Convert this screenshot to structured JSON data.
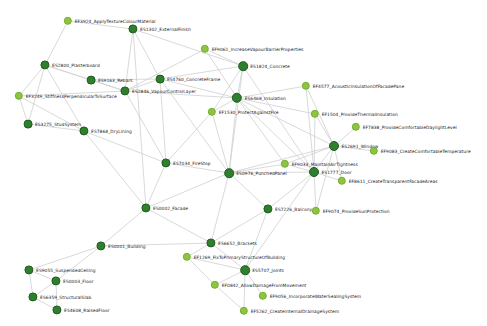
{
  "view": {
    "title": "Building Element / Function Network Graph",
    "background_color": "#ffffff",
    "edge_color": "#cfcfcf",
    "node_color_dark": "#2f7f2f",
    "node_color_light": "#8cc63f",
    "label_color": "#20201f",
    "width": 487,
    "height": 326
  },
  "chart_data": {
    "type": "network",
    "title": "",
    "node_count": 37,
    "edge_count": 71,
    "nodes": [
      {
        "id": "EF3924",
        "label": "EF3924_ApplyTextureColourMaterial",
        "x": 68,
        "y": 21,
        "r": 4.2,
        "kind": "light",
        "label_side": "right"
      },
      {
        "id": "ES1302",
        "label": "ES1302_ExternalFinish",
        "x": 133,
        "y": 29,
        "r": 4.6,
        "kind": "dark",
        "label_side": "right"
      },
      {
        "id": "EF9061",
        "label": "EF9061_IncreaseVapourBarrierProperties",
        "x": 205,
        "y": 49,
        "r": 4.2,
        "kind": "light",
        "label_side": "right"
      },
      {
        "id": "ES2800",
        "label": "ES2800_Plasterboard",
        "x": 45,
        "y": 65,
        "r": 4.6,
        "kind": "dark",
        "label_side": "right"
      },
      {
        "id": "ES1824",
        "label": "ES1824_Concrete",
        "x": 243,
        "y": 66,
        "r": 4.8,
        "kind": "dark",
        "label_side": "right"
      },
      {
        "id": "ES9163",
        "label": "ES9163_Rebars",
        "x": 91,
        "y": 80,
        "r": 4.4,
        "kind": "dark",
        "label_side": "right"
      },
      {
        "id": "ES4760",
        "label": "ES4760_ConcreteFrame",
        "x": 160,
        "y": 79,
        "r": 4.4,
        "kind": "dark",
        "label_side": "right"
      },
      {
        "id": "EF4577",
        "label": "EF4577_AcousticInsulationOfFacadePane",
        "x": 306,
        "y": 86,
        "r": 4.2,
        "kind": "light",
        "label_side": "right"
      },
      {
        "id": "EF3249",
        "label": "EF3249_StiffnessPerpendicularToSurface",
        "x": 19,
        "y": 96,
        "r": 4.2,
        "kind": "light",
        "label_side": "right"
      },
      {
        "id": "ES2846",
        "label": "ES2846_VapourControlLayer",
        "x": 125,
        "y": 91,
        "r": 4.6,
        "kind": "dark",
        "label_side": "right"
      },
      {
        "id": "ES6468",
        "label": "ES6468_Insulation",
        "x": 237,
        "y": 98,
        "r": 5.2,
        "kind": "dark",
        "label_side": "right"
      },
      {
        "id": "EF1530",
        "label": "EF1530_ProtectAgainstFire",
        "x": 212,
        "y": 112,
        "r": 4.2,
        "kind": "light",
        "label_side": "right"
      },
      {
        "id": "EF1504",
        "label": "EF1504_ProvideThermalInsulation",
        "x": 315,
        "y": 114,
        "r": 4.2,
        "kind": "light",
        "label_side": "right"
      },
      {
        "id": "ES3275",
        "label": "ES3275_StudSystem",
        "x": 28,
        "y": 124,
        "r": 4.4,
        "kind": "dark",
        "label_side": "right"
      },
      {
        "id": "EF7838",
        "label": "EF7838_ProvideComfortableDaylightLevel",
        "x": 356,
        "y": 127,
        "r": 4.2,
        "kind": "light",
        "label_side": "right"
      },
      {
        "id": "ES7868",
        "label": "ES7868_DryLining",
        "x": 84,
        "y": 131,
        "r": 4.6,
        "kind": "dark",
        "label_side": "right"
      },
      {
        "id": "ES2691",
        "label": "ES2691_Window",
        "x": 334,
        "y": 146,
        "r": 5.0,
        "kind": "dark",
        "label_side": "right"
      },
      {
        "id": "EF9083",
        "label": "EF9083_CreateComfortableTemperature",
        "x": 374,
        "y": 151,
        "r": 4.2,
        "kind": "light",
        "label_side": "right"
      },
      {
        "id": "EF9033",
        "label": "EF9033_MaintainAirTightness",
        "x": 285,
        "y": 164,
        "r": 4.2,
        "kind": "light",
        "label_side": "right"
      },
      {
        "id": "ES7034",
        "label": "ES7034_FireStop",
        "x": 166,
        "y": 163,
        "r": 4.6,
        "kind": "dark",
        "label_side": "right"
      },
      {
        "id": "ES1777",
        "label": "ES1777_Door",
        "x": 314,
        "y": 172,
        "r": 5.0,
        "kind": "dark",
        "label_side": "right"
      },
      {
        "id": "ES0976",
        "label": "ES0976_PunchedPanel",
        "x": 229,
        "y": 173,
        "r": 4.8,
        "kind": "dark",
        "label_side": "right"
      },
      {
        "id": "EF8611",
        "label": "EF8611_CreateTransparentFacadeAreas",
        "x": 342,
        "y": 181,
        "r": 4.2,
        "kind": "light",
        "label_side": "right"
      },
      {
        "id": "ES7226",
        "label": "ES7226_Balcony",
        "x": 268,
        "y": 209,
        "r": 4.6,
        "kind": "dark",
        "label_side": "right"
      },
      {
        "id": "EF9074",
        "label": "EF9074_ProvideSunProtection",
        "x": 316,
        "y": 211,
        "r": 4.2,
        "kind": "light",
        "label_side": "right"
      },
      {
        "id": "ES0002",
        "label": "ES0002_Facade",
        "x": 146,
        "y": 208,
        "r": 4.6,
        "kind": "dark",
        "label_side": "right"
      },
      {
        "id": "ES0001",
        "label": "ES0001_Building",
        "x": 101,
        "y": 246,
        "r": 4.6,
        "kind": "dark",
        "label_side": "right"
      },
      {
        "id": "ES6652",
        "label": "ES6652_Brackets",
        "x": 211,
        "y": 243,
        "r": 4.6,
        "kind": "dark",
        "label_side": "right"
      },
      {
        "id": "EF1269",
        "label": "EF1269_FixToPrimaryStructureOfBuilding",
        "x": 187,
        "y": 257,
        "r": 4.2,
        "kind": "light",
        "label_side": "right"
      },
      {
        "id": "ES9055",
        "label": "ES9055_SuspendedCeiling",
        "x": 29,
        "y": 270,
        "r": 4.6,
        "kind": "dark",
        "label_side": "right"
      },
      {
        "id": "ES5707",
        "label": "ES5707_Joints",
        "x": 245,
        "y": 270,
        "r": 4.8,
        "kind": "dark",
        "label_side": "right"
      },
      {
        "id": "ES0003",
        "label": "ES0003_Floor",
        "x": 56,
        "y": 281,
        "r": 4.6,
        "kind": "dark",
        "label_side": "right"
      },
      {
        "id": "EF0842",
        "label": "EF0842_AllowDamageFromMovement",
        "x": 215,
        "y": 285,
        "r": 4.2,
        "kind": "light",
        "label_side": "right"
      },
      {
        "id": "ES6359",
        "label": "ES6359_StructuralSlab",
        "x": 33,
        "y": 297,
        "r": 4.6,
        "kind": "dark",
        "label_side": "right"
      },
      {
        "id": "EF9056",
        "label": "EF9056_IncorporateWaterSealingSystem",
        "x": 263,
        "y": 296,
        "r": 4.2,
        "kind": "light",
        "label_side": "right"
      },
      {
        "id": "ES4608",
        "label": "ES4608_RaisedFloor",
        "x": 57,
        "y": 310,
        "r": 4.6,
        "kind": "dark",
        "label_side": "right"
      },
      {
        "id": "EF5262",
        "label": "EF5262_CreateInternalDrainageSystem",
        "x": 244,
        "y": 311,
        "r": 4.2,
        "kind": "light",
        "label_side": "right"
      }
    ],
    "edges": [
      [
        "EF3924",
        "ES1302"
      ],
      [
        "EF3924",
        "ES2800"
      ],
      [
        "ES1302",
        "ES4760"
      ],
      [
        "ES1302",
        "ES2846"
      ],
      [
        "ES1302",
        "ES1824"
      ],
      [
        "ES1302",
        "ES0002"
      ],
      [
        "ES2800",
        "ES9163"
      ],
      [
        "ES2800",
        "EF3249"
      ],
      [
        "ES2800",
        "ES3275"
      ],
      [
        "ES2800",
        "ES7868"
      ],
      [
        "ES2800",
        "ES2846"
      ],
      [
        "EF9061",
        "ES1824"
      ],
      [
        "EF9061",
        "ES2846"
      ],
      [
        "EF9061",
        "ES6468"
      ],
      [
        "ES1824",
        "ES4760"
      ],
      [
        "ES1824",
        "ES6468"
      ],
      [
        "ES1824",
        "EF1530"
      ],
      [
        "ES1824",
        "ES0976"
      ],
      [
        "ES1824",
        "ES1777"
      ],
      [
        "ES9163",
        "ES4760"
      ],
      [
        "ES9163",
        "ES2846"
      ],
      [
        "ES4760",
        "ES2846"
      ],
      [
        "ES4760",
        "ES6468"
      ],
      [
        "ES4760",
        "ES7034"
      ],
      [
        "ES4760",
        "ES0976"
      ],
      [
        "EF4577",
        "ES6468"
      ],
      [
        "EF4577",
        "ES2691"
      ],
      [
        "EF4577",
        "ES1777"
      ],
      [
        "EF3249",
        "ES3275"
      ],
      [
        "EF3249",
        "ES7868"
      ],
      [
        "EF3249",
        "ES2846"
      ],
      [
        "ES2846",
        "ES6468"
      ],
      [
        "ES2846",
        "ES7034"
      ],
      [
        "ES6468",
        "EF1530"
      ],
      [
        "ES6468",
        "EF1504"
      ],
      [
        "ES6468",
        "ES2691"
      ],
      [
        "ES6468",
        "ES1777"
      ],
      [
        "ES6468",
        "ES0976"
      ],
      [
        "ES6468",
        "EF9033"
      ],
      [
        "EF1530",
        "ES7034"
      ],
      [
        "EF1530",
        "ES0976"
      ],
      [
        "EF1504",
        "ES2691"
      ],
      [
        "EF1504",
        "ES1777"
      ],
      [
        "ES3275",
        "ES7868"
      ],
      [
        "EF7838",
        "ES2691"
      ],
      [
        "ES7868",
        "ES7034"
      ],
      [
        "ES7868",
        "ES0002"
      ],
      [
        "ES2691",
        "EF9083"
      ],
      [
        "ES2691",
        "EF9033"
      ],
      [
        "ES2691",
        "ES1777"
      ],
      [
        "ES2691",
        "EF8611"
      ],
      [
        "ES2691",
        "ES0976"
      ],
      [
        "ES2691",
        "EF9074"
      ],
      [
        "EF9033",
        "ES1777"
      ],
      [
        "EF9033",
        "ES0976"
      ],
      [
        "ES7034",
        "ES0976"
      ],
      [
        "ES7034",
        "ES0002"
      ],
      [
        "ES1777",
        "ES0976"
      ],
      [
        "ES1777",
        "EF8611"
      ],
      [
        "ES1777",
        "EF9074"
      ],
      [
        "ES1777",
        "ES7226"
      ],
      [
        "ES1777",
        "ES5707"
      ],
      [
        "ES0976",
        "ES0002"
      ],
      [
        "ES0976",
        "ES7226"
      ],
      [
        "ES0976",
        "ES6652"
      ],
      [
        "ES7226",
        "ES6652"
      ],
      [
        "ES7226",
        "ES5707"
      ],
      [
        "ES0002",
        "ES0001"
      ],
      [
        "ES0002",
        "ES6652"
      ],
      [
        "ES0001",
        "ES9055"
      ],
      [
        "ES0001",
        "ES0003"
      ],
      [
        "ES0001",
        "ES6652"
      ],
      [
        "ES6652",
        "EF1269"
      ],
      [
        "ES6652",
        "ES5707"
      ],
      [
        "EF1269",
        "ES5707"
      ],
      [
        "EF1269",
        "EF0842"
      ],
      [
        "ES9055",
        "ES0003"
      ],
      [
        "ES9055",
        "ES6359"
      ],
      [
        "ES5707",
        "EF0842"
      ],
      [
        "ES5707",
        "EF9056"
      ],
      [
        "ES5707",
        "EF5262"
      ],
      [
        "ES0003",
        "ES6359"
      ],
      [
        "ES0003",
        "ES4608"
      ],
      [
        "EF0842",
        "EF5262"
      ],
      [
        "ES6359",
        "ES4608"
      ]
    ]
  }
}
